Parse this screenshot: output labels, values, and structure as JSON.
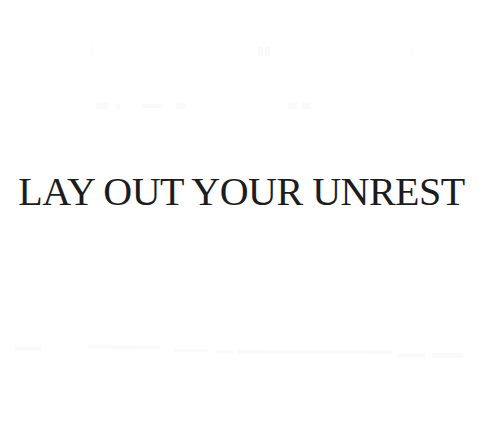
{
  "colors": {
    "background": "#ffffff",
    "title": "#1c1c1e",
    "artifact": "#fafafa"
  },
  "title": {
    "text": "LAY OUT YOUR UNREST"
  }
}
